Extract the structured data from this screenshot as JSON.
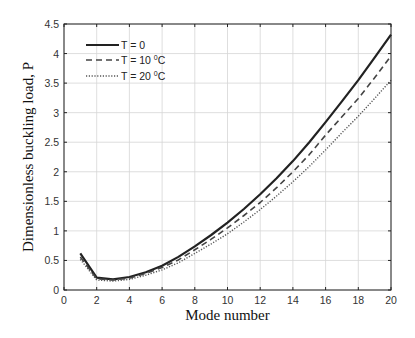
{
  "chart_data": {
    "type": "line",
    "title": "",
    "xlabel": "Mode number",
    "ylabel": "Dimensionless buckling load,  P",
    "xlim": [
      0,
      20
    ],
    "ylim": [
      0,
      4.5
    ],
    "xticks": [
      0,
      2,
      4,
      6,
      8,
      10,
      12,
      14,
      16,
      18,
      20
    ],
    "yticks": [
      0,
      0.5,
      1,
      1.5,
      2,
      2.5,
      3,
      3.5,
      4,
      4.5
    ],
    "xtick_labels": [
      "0",
      "2",
      "4",
      "6",
      "8",
      "10",
      "12",
      "14",
      "16",
      "18",
      "20"
    ],
    "ytick_labels": [
      "0",
      "0.5",
      "1",
      "1.5",
      "2",
      "2.5",
      "3",
      "3.5",
      "4",
      "4.5"
    ],
    "grid": true,
    "legend_position": "upper left",
    "x": [
      1,
      2,
      3,
      4,
      5,
      6,
      7,
      8,
      9,
      10,
      11,
      12,
      13,
      14,
      15,
      16,
      17,
      18,
      19,
      20
    ],
    "series": [
      {
        "name": "T = 0",
        "legend_main": "T = 0",
        "legend_sup": "",
        "legend_tail": "",
        "style": "solid",
        "color": "#222222",
        "values": [
          0.62,
          0.21,
          0.18,
          0.22,
          0.3,
          0.41,
          0.56,
          0.74,
          0.93,
          1.14,
          1.37,
          1.62,
          1.89,
          2.18,
          2.5,
          2.84,
          3.19,
          3.55,
          3.93,
          4.32
        ]
      },
      {
        "name": "T = 10 °C",
        "legend_main": "T = 10 ",
        "legend_sup": "0",
        "legend_tail": "C",
        "style": "dashed",
        "color": "#444444",
        "values": [
          0.56,
          0.19,
          0.17,
          0.2,
          0.28,
          0.38,
          0.51,
          0.68,
          0.86,
          1.05,
          1.26,
          1.48,
          1.73,
          2.0,
          2.29,
          2.62,
          2.93,
          3.24,
          3.59,
          3.96
        ]
      },
      {
        "name": "T = 20 °C",
        "legend_main": "T = 20 ",
        "legend_sup": "0",
        "legend_tail": "C",
        "style": "dotted",
        "color": "#555555",
        "values": [
          0.52,
          0.17,
          0.15,
          0.18,
          0.25,
          0.34,
          0.46,
          0.62,
          0.78,
          0.95,
          1.15,
          1.36,
          1.59,
          1.83,
          2.09,
          2.37,
          2.66,
          2.94,
          3.24,
          3.55
        ]
      }
    ]
  }
}
